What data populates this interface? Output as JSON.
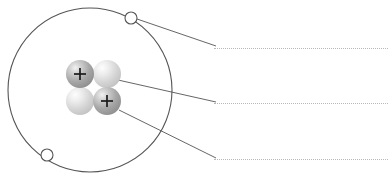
{
  "diagram": {
    "canvas": {
      "width": 392,
      "height": 184,
      "background": "#ffffff"
    },
    "orbit": {
      "name": "electron-orbit",
      "center_x": 90,
      "center_y": 90,
      "radius": 82,
      "stroke": "#555555",
      "stroke_width": 1,
      "fill": "none"
    },
    "electrons": [
      {
        "label": "electron",
        "cx": 131,
        "cy": 18,
        "r": 6,
        "stroke": "#555555",
        "fill": "#ffffff"
      },
      {
        "label": "electron",
        "cx": 47,
        "cy": 155,
        "r": 6,
        "stroke": "#555555",
        "fill": "#ffffff"
      }
    ],
    "nucleus": {
      "name": "nucleus",
      "particles": [
        {
          "label": "proton",
          "symbol": "+",
          "cx": 80,
          "cy": 74,
          "r": 14,
          "color": "#a6a6a6",
          "highlight": "#e8e8e8"
        },
        {
          "label": "neutron",
          "symbol": "",
          "cx": 107,
          "cy": 74,
          "r": 14,
          "color": "#d6d6d6",
          "highlight": "#f4f4f4"
        },
        {
          "label": "neutron",
          "symbol": "",
          "cx": 80,
          "cy": 101,
          "r": 14,
          "color": "#d6d6d6",
          "highlight": "#f4f4f4"
        },
        {
          "label": "proton",
          "symbol": "+",
          "cx": 107,
          "cy": 101,
          "r": 14,
          "color": "#a6a6a6",
          "highlight": "#e8e8e8"
        }
      ]
    },
    "leader_lines": [
      {
        "label": "leader-to-electron",
        "x1": 137,
        "y1": 19,
        "x2": 216,
        "y2": 46,
        "stroke": "#555555"
      },
      {
        "label": "leader-to-neutron",
        "x1": 118,
        "y1": 80,
        "x2": 216,
        "y2": 102,
        "stroke": "#555555"
      },
      {
        "label": "leader-to-proton",
        "x1": 119,
        "y1": 110,
        "x2": 216,
        "y2": 158,
        "stroke": "#555555"
      }
    ],
    "answer_lines": [
      {
        "label": "answer-line-electron",
        "value": "",
        "left": 214,
        "top": 48,
        "width": 174
      },
      {
        "label": "answer-line-neutron",
        "value": "",
        "left": 214,
        "top": 103,
        "width": 174
      },
      {
        "label": "answer-line-proton",
        "value": "",
        "left": 214,
        "top": 159,
        "width": 174
      }
    ]
  }
}
